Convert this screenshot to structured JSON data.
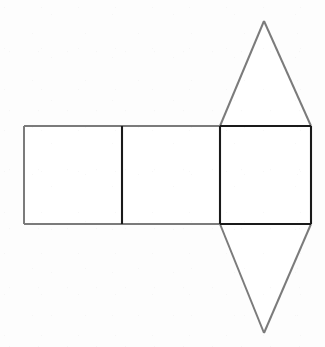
{
  "figure": {
    "canvas": {
      "width": 325,
      "height": 347,
      "background_color": "#fdfdfd"
    },
    "colors": {
      "light_edge": "#7b7b7b",
      "dark_edge": "#1a1a1a",
      "face_fill": "#ffffff"
    },
    "stroke_widths": {
      "light_edge": 2,
      "dark_edge": 2.1
    },
    "geometry": {
      "rect_top_y": 126,
      "rect_bottom_y": 224,
      "x_left": 24,
      "x_div1": 122,
      "x_div2": 220,
      "x_right": 311,
      "apex_top": {
        "x": 264,
        "y": 21
      },
      "apex_bottom": {
        "x": 264,
        "y": 333
      }
    },
    "shapes": [
      {
        "id": "rect-left",
        "name": "left-rectangle",
        "kind": "rectangle",
        "points": "24,126 122,126 122,224 24,224",
        "edge_style": "light"
      },
      {
        "id": "rect-middle",
        "name": "middle-rectangle",
        "kind": "rectangle",
        "points": "122,126 220,126 220,224 122,224",
        "edge_style": "light"
      },
      {
        "id": "rect-right",
        "name": "right-rectangle",
        "kind": "rectangle",
        "points": "220,126 311,126 311,224 220,224",
        "edge_style": "dark"
      },
      {
        "id": "tri-top",
        "name": "top-triangle",
        "kind": "triangle",
        "points": "220,126 311,126 264,21",
        "edge_style": "light"
      },
      {
        "id": "tri-bottom",
        "name": "bottom-triangle",
        "kind": "triangle",
        "points": "220,224 311,224 264,333",
        "edge_style": "light"
      }
    ],
    "edges": [
      {
        "id": "edge-left-outer",
        "name": "left-rectangle-left-edge",
        "d": "M 24,126 L 24,224",
        "style": "light"
      },
      {
        "id": "edge-top-left-span",
        "name": "left-rectangle-top-edge",
        "d": "M 24,126 L 122,126",
        "style": "light"
      },
      {
        "id": "edge-bottom-left-span",
        "name": "left-rectangle-bottom-edge",
        "d": "M 24,224 L 122,224",
        "style": "light"
      },
      {
        "id": "edge-div1",
        "name": "first-divider-edge",
        "d": "M 122,126 L 122,224",
        "style": "dark"
      },
      {
        "id": "edge-top-mid-span",
        "name": "middle-rectangle-top-edge",
        "d": "M 122,126 L 220,126",
        "style": "light"
      },
      {
        "id": "edge-bottom-mid-span",
        "name": "middle-rectangle-bottom-edge",
        "d": "M 122,224 L 220,224",
        "style": "light"
      },
      {
        "id": "edge-div2",
        "name": "second-divider-edge",
        "d": "M 220,126 L 220,224",
        "style": "dark"
      },
      {
        "id": "edge-top-right-span",
        "name": "right-rectangle-top-edge",
        "d": "M 220,126 L 311,126",
        "style": "dark"
      },
      {
        "id": "edge-bottom-right-span",
        "name": "right-rectangle-bottom-edge",
        "d": "M 220,224 L 311,224",
        "style": "dark"
      },
      {
        "id": "edge-right-outer",
        "name": "right-rectangle-right-edge",
        "d": "M 311,126 L 311,224",
        "style": "dark"
      },
      {
        "id": "edge-tri-top-left",
        "name": "top-triangle-left-edge",
        "d": "M 220,126 L 264,21",
        "style": "light"
      },
      {
        "id": "edge-tri-top-right",
        "name": "top-triangle-right-edge",
        "d": "M 264,21 L 311,126",
        "style": "light"
      },
      {
        "id": "edge-tri-bottom-left",
        "name": "bottom-triangle-left-edge",
        "d": "M 220,224 L 264,333",
        "style": "light"
      },
      {
        "id": "edge-tri-bottom-right",
        "name": "bottom-triangle-right-edge",
        "d": "M 264,333 L 311,224",
        "style": "light"
      }
    ],
    "labels": []
  }
}
